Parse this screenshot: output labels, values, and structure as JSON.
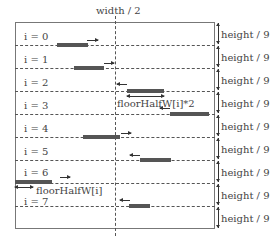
{
  "diagram": {
    "top_label": "width / 2",
    "row_height_label": "height / 9",
    "row_count": 9,
    "rows": [
      {
        "label": "i = 0",
        "direction": "right"
      },
      {
        "label": "i = 1",
        "direction": "right"
      },
      {
        "label": "i = 2",
        "direction": "left"
      },
      {
        "label": "i = 3",
        "direction": "left"
      },
      {
        "label": "i = 4",
        "direction": "right"
      },
      {
        "label": "i = 5",
        "direction": "left"
      },
      {
        "label": "i = 6",
        "direction": "right"
      },
      {
        "label": "i = 7",
        "direction": "left"
      }
    ],
    "annotations": {
      "full_width": "floorHalfW[i]*2",
      "half_width": "floorHalfW[i]"
    },
    "colors": {
      "bar": "#555555",
      "lines": "#555555",
      "text": "#444444"
    }
  }
}
